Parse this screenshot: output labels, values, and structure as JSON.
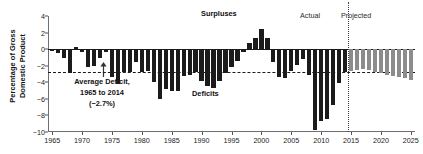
{
  "chart_data": {
    "type": "bar",
    "title": "",
    "subtitle": "",
    "xlabel": "",
    "ylabel": "Percentage of Gross Domestic Product",
    "ylabel_lines": [
      "Percentage of Gross",
      "Domestic Product"
    ],
    "xlim": [
      1964.3,
      2025.7
    ],
    "ylim": [
      -10,
      4
    ],
    "yticks": [
      4,
      2,
      0,
      -2,
      -4,
      -6,
      -8,
      -10
    ],
    "ytick_labels": [
      "4",
      "2",
      "0",
      "−2",
      "−4",
      "−6",
      "−8",
      "−10"
    ],
    "xticks": [
      1965,
      1970,
      1975,
      1980,
      1985,
      1990,
      1995,
      2000,
      2005,
      2010,
      2015,
      2020,
      2025
    ],
    "xtick_labels": [
      "1965",
      "1970",
      "1975",
      "1980",
      "1985",
      "1990",
      "1995",
      "2000",
      "2005",
      "2010",
      "2015",
      "2020",
      "2025"
    ],
    "grid": false,
    "legend": "none",
    "reference_lines": [
      {
        "name": "zero-line",
        "value": 0,
        "style": "solid",
        "color": "#1a1a1a"
      },
      {
        "name": "average-deficit-line",
        "value": -2.7,
        "style": "dashed",
        "color": "#1a1a1a"
      },
      {
        "name": "actual-projected-divider",
        "value": 2014.5,
        "orientation": "vertical",
        "style": "dotted",
        "color": "#3a3a3a"
      }
    ],
    "series": [
      {
        "name": "Actual",
        "color": "#1b1b1b",
        "x": [
          1965,
          1966,
          1967,
          1968,
          1969,
          1970,
          1971,
          1972,
          1973,
          1974,
          1975,
          1976,
          1977,
          1978,
          1979,
          1980,
          1981,
          1982,
          1983,
          1984,
          1985,
          1986,
          1987,
          1988,
          1989,
          1990,
          1991,
          1992,
          1993,
          1994,
          1995,
          1996,
          1997,
          1998,
          1999,
          2000,
          2001,
          2002,
          2003,
          2004,
          2005,
          2006,
          2007,
          2008,
          2009,
          2010,
          2011,
          2012,
          2013,
          2014
        ],
        "values": [
          -0.2,
          -0.5,
          -1.1,
          -2.9,
          0.3,
          -0.3,
          -2.1,
          -2.0,
          -1.1,
          -0.4,
          -3.4,
          -4.2,
          -2.7,
          -2.7,
          -1.6,
          -2.7,
          -2.6,
          -4.0,
          -6.0,
          -4.8,
          -5.1,
          -5.0,
          -3.2,
          -3.1,
          -2.8,
          -3.9,
          -4.5,
          -4.7,
          -3.9,
          -2.9,
          -2.2,
          -1.4,
          -0.3,
          0.8,
          1.4,
          2.4,
          1.3,
          -1.5,
          -3.4,
          -3.5,
          -2.6,
          -1.9,
          -1.2,
          -3.1,
          -9.8,
          -8.7,
          -8.4,
          -6.8,
          -4.1,
          -2.8
        ]
      },
      {
        "name": "Projected",
        "color": "#8c8c8c",
        "x": [
          2015,
          2016,
          2017,
          2018,
          2019,
          2020,
          2021,
          2022,
          2023,
          2024,
          2025
        ],
        "values": [
          -2.6,
          -2.5,
          -2.4,
          -2.5,
          -2.7,
          -2.9,
          -3.1,
          -3.3,
          -3.4,
          -3.5,
          -3.7
        ]
      }
    ],
    "annotations": [
      {
        "name": "surpluses-label",
        "text": "Surpluses",
        "x": 2000,
        "y": 3.2
      },
      {
        "name": "deficits-label",
        "text": "Deficits",
        "x": 1995,
        "y": -4.8
      },
      {
        "name": "average-deficit-callout",
        "lines": [
          "Average Deficit,",
          "1965 to 2014",
          "(−2.7%)"
        ],
        "value": -2.7,
        "x": 1973,
        "y": -5.6
      },
      {
        "name": "actual-label",
        "text": "Actual",
        "x": 2011,
        "y": 4.0
      },
      {
        "name": "projected-label",
        "text": "Projected",
        "x": 2018,
        "y": 4.0
      }
    ]
  }
}
